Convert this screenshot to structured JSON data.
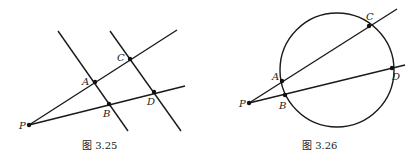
{
  "figures": [
    {
      "caption": "图 3.25",
      "description": "Two parallel lines cut by two rays from P",
      "points": {
        "P": "P",
        "A": "A",
        "B": "B",
        "C": "C",
        "D": "D"
      }
    },
    {
      "caption": "图 3.26",
      "description": "Two secants from P intersecting a circle",
      "points": {
        "P": "P",
        "A": "A",
        "B": "B",
        "C": "C",
        "D": "D"
      }
    }
  ]
}
